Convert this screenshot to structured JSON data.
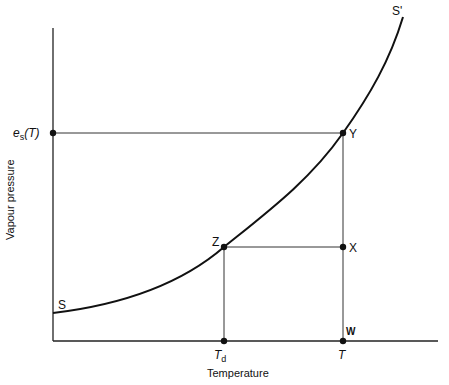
{
  "diagram": {
    "title": "",
    "axes": {
      "x_label": "Temperature",
      "y_label": "Vapour pressure"
    },
    "curve": {
      "start_label": "S",
      "end_label": "S'",
      "description": "saturation vapour pressure curve"
    },
    "points": {
      "Y": "Y",
      "X": "X",
      "Z": "Z",
      "W": "W"
    },
    "ticks": {
      "y_tick": "e",
      "y_tick_sub": "s",
      "y_tick_arg": "(T)",
      "x_tick_td": "T",
      "x_tick_td_sub": "d",
      "x_tick_t": "T"
    },
    "colors": {
      "line": "#111111",
      "background": "#ffffff"
    }
  }
}
